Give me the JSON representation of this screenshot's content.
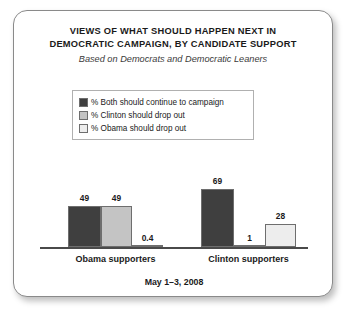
{
  "card": {
    "title_lines": [
      "VIEWS OF WHAT SHOULD HAPPEN NEXT IN",
      "DEMOCRATIC CAMPAIGN, BY CANDIDATE SUPPORT"
    ],
    "subtitle": "Based on Democrats and Democratic Leaners",
    "footer": "May 1–3, 2008"
  },
  "colors": {
    "series_dark": "#3f3f3f",
    "series_mid": "#c4c4c4",
    "series_light": "#ededed",
    "bar_outline": "#6e6e6e",
    "axis": "#4a4a4a",
    "card_border": "#8a8a8a",
    "text": "#1a1a1a"
  },
  "chart_data": {
    "type": "bar",
    "title": "VIEWS OF WHAT SHOULD HAPPEN NEXT IN DEMOCRATIC CAMPAIGN, BY CANDIDATE SUPPORT",
    "subtitle": "Based on Democrats and Democratic Leaners",
    "note": "May 1–3, 2008",
    "categories": [
      "Obama supporters",
      "Clinton supporters"
    ],
    "xlabel": "",
    "ylabel": "",
    "ylim": [
      0,
      100
    ],
    "grid": false,
    "legend_position": "top-center",
    "series": [
      {
        "name": "% Both should continue to campaign",
        "color": "#3f3f3f",
        "values": [
          49,
          69
        ],
        "labels": [
          "49",
          "69"
        ]
      },
      {
        "name": "% Clinton should drop out",
        "color": "#c4c4c4",
        "values": [
          49,
          1
        ],
        "labels": [
          "49",
          "1"
        ]
      },
      {
        "name": "% Obama should drop out",
        "color": "#ededed",
        "values": [
          0.4,
          28
        ],
        "labels": [
          "0.4",
          "28"
        ]
      }
    ]
  }
}
